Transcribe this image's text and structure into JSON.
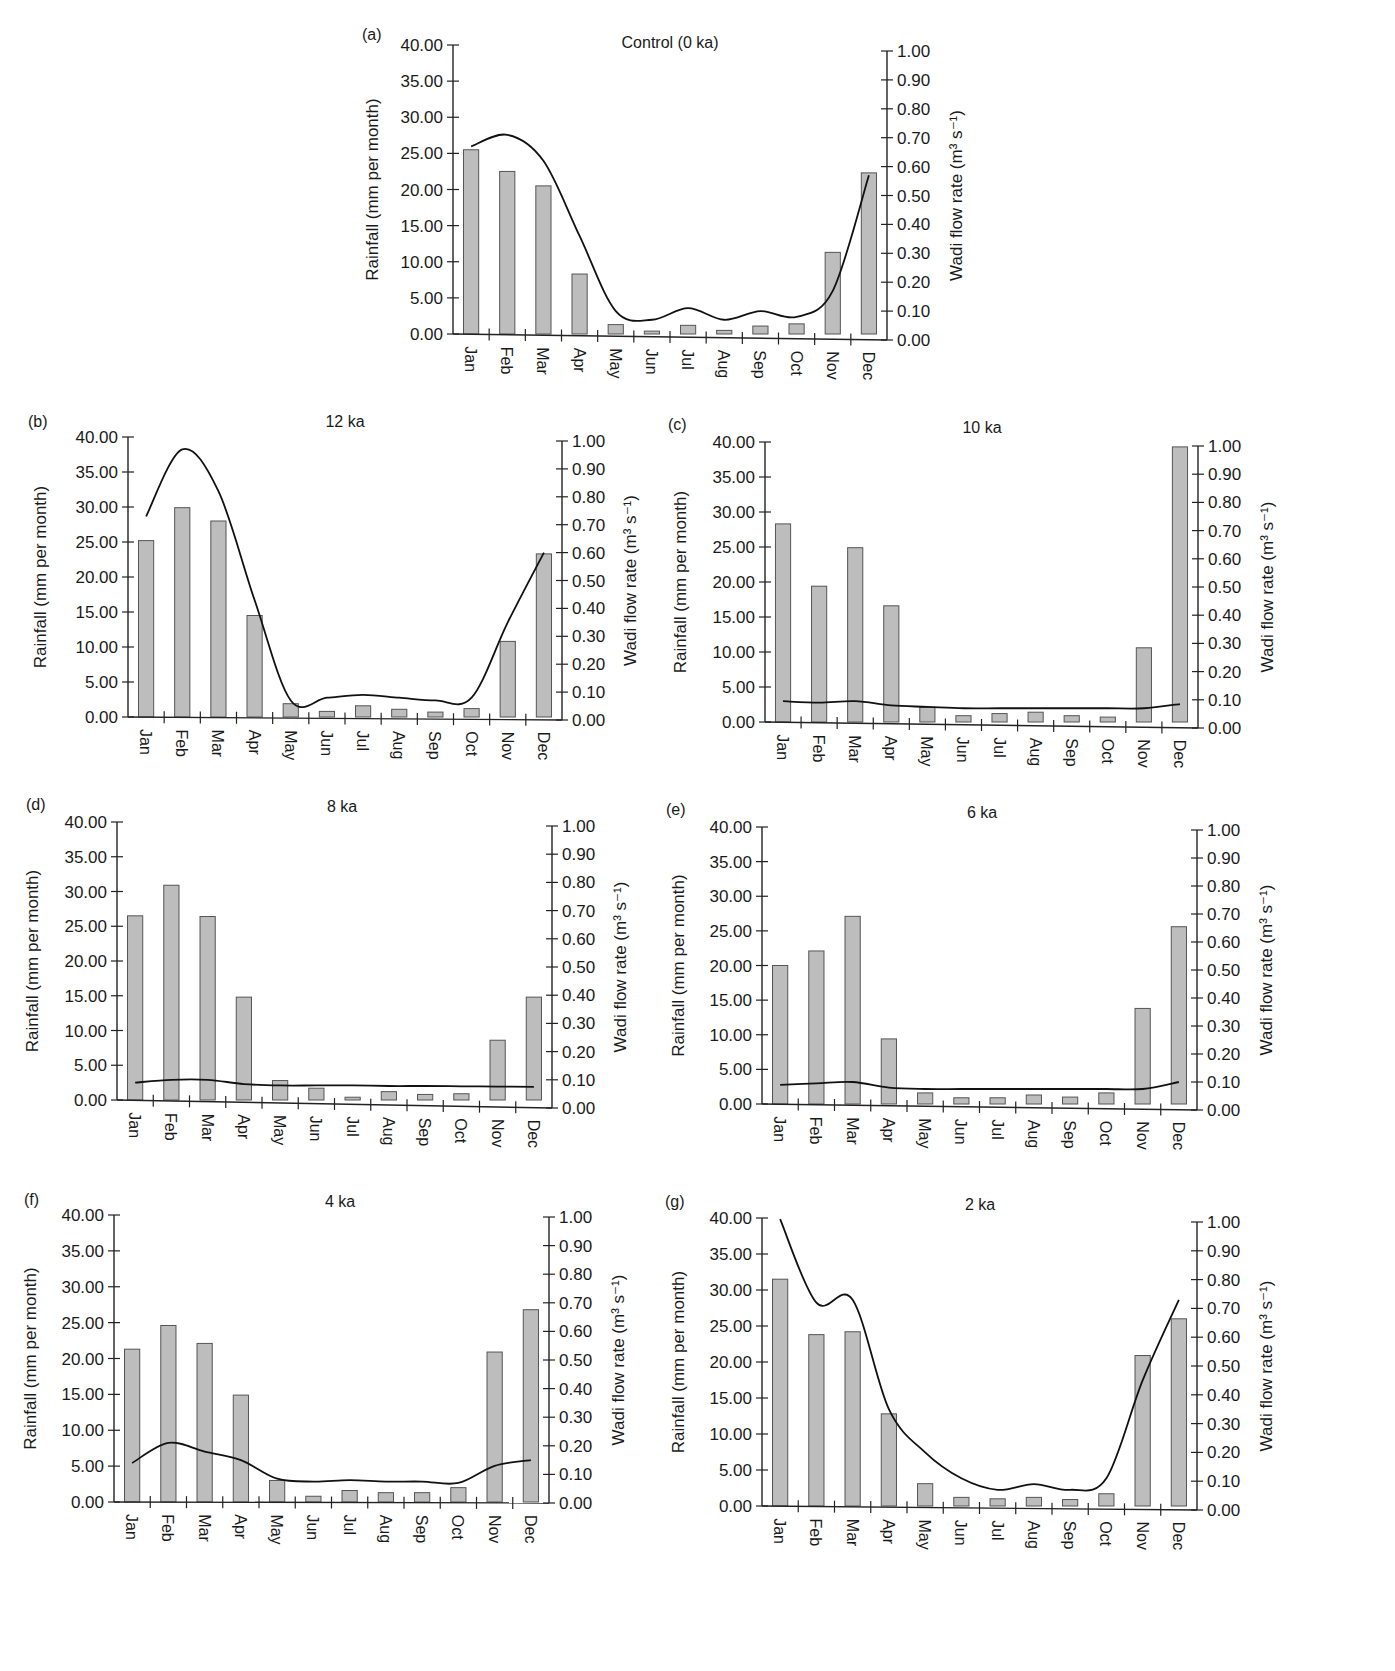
{
  "figure": {
    "months": [
      "Jan",
      "Feb",
      "Mar",
      "Apr",
      "May",
      "Jun",
      "Jul",
      "Aug",
      "Sep",
      "Oct",
      "Nov",
      "Dec"
    ],
    "left_axis_title": "Rainfall (mm per month)",
    "right_axis_title": "Wadi flow rate (m³ s⁻¹)",
    "left_ticks": [
      "0.00",
      "5.00",
      "10.00",
      "15.00",
      "20.00",
      "25.00",
      "30.00",
      "35.00",
      "40.00"
    ],
    "right_ticks": [
      "0.00",
      "0.10",
      "0.20",
      "0.30",
      "0.40",
      "0.50",
      "0.60",
      "0.70",
      "0.80",
      "0.90",
      "1.00"
    ],
    "bar_color": "#bdbdbd",
    "line_color": "#111111"
  },
  "chart_data": [
    {
      "panel": "(a)",
      "type": "bar+line",
      "title": "Control (0 ka)",
      "xlabel": "",
      "ylabel": "Rainfall (mm per month)",
      "y2label": "Wadi flow rate (m³ s⁻¹)",
      "ylim": [
        0,
        40
      ],
      "y2lim": [
        0,
        1
      ],
      "categories": [
        "Jan",
        "Feb",
        "Mar",
        "Apr",
        "May",
        "Jun",
        "Jul",
        "Aug",
        "Sep",
        "Oct",
        "Nov",
        "Dec"
      ],
      "series": [
        {
          "name": "Rainfall",
          "type": "bar",
          "axis": "left",
          "values": [
            25.5,
            22.5,
            20.5,
            8.3,
            1.3,
            0.4,
            1.2,
            0.5,
            1.1,
            1.4,
            11.3,
            22.3
          ]
        },
        {
          "name": "Wadi flow rate",
          "type": "line",
          "axis": "right",
          "values": [
            0.67,
            0.71,
            0.62,
            0.36,
            0.1,
            0.07,
            0.11,
            0.07,
            0.1,
            0.08,
            0.17,
            0.57
          ]
        }
      ],
      "layout": {
        "x0": 453,
        "x1": 887,
        "yTop": 45,
        "yBot": 334,
        "rTop": 51,
        "rBot": 340,
        "title_x": 670,
        "title_y": 48,
        "letter_x": 362,
        "letter_y": 40,
        "ylab_x": 378,
        "y2lab_x": 962
      }
    },
    {
      "panel": "(b)",
      "type": "bar+line",
      "title": "12 ka",
      "xlabel": "",
      "ylabel": "Rainfall (mm per month)",
      "y2label": "Wadi flow rate (m³ s⁻¹)",
      "ylim": [
        0,
        40
      ],
      "y2lim": [
        0,
        1
      ],
      "categories": [
        "Jan",
        "Feb",
        "Mar",
        "Apr",
        "May",
        "Jun",
        "Jul",
        "Aug",
        "Sep",
        "Oct",
        "Nov",
        "Dec"
      ],
      "series": [
        {
          "name": "Rainfall",
          "type": "bar",
          "axis": "left",
          "values": [
            25.2,
            29.9,
            28.0,
            14.5,
            1.9,
            0.8,
            1.6,
            1.1,
            0.7,
            1.2,
            10.8,
            23.3
          ]
        },
        {
          "name": "Wadi flow rate",
          "type": "line",
          "axis": "right",
          "values": [
            0.73,
            0.97,
            0.82,
            0.43,
            0.07,
            0.08,
            0.09,
            0.08,
            0.07,
            0.08,
            0.35,
            0.6
          ]
        }
      ],
      "layout": {
        "x0": 128,
        "x1": 562,
        "yTop": 437,
        "yBot": 717,
        "rTop": 441,
        "rBot": 720,
        "title_x": 345,
        "title_y": 427,
        "letter_x": 28,
        "letter_y": 427,
        "ylab_x": 46,
        "y2lab_x": 636
      }
    },
    {
      "panel": "(c)",
      "type": "bar+line",
      "title": "10 ka",
      "xlabel": "",
      "ylabel": "Rainfall (mm per month)",
      "y2label": "Wadi flow rate (m³ s⁻¹)",
      "ylim": [
        0,
        40
      ],
      "y2lim": [
        0,
        1
      ],
      "categories": [
        "Jan",
        "Feb",
        "Mar",
        "Apr",
        "May",
        "Jun",
        "Jul",
        "Aug",
        "Sep",
        "Oct",
        "Nov",
        "Dec"
      ],
      "series": [
        {
          "name": "Rainfall",
          "type": "bar",
          "axis": "left",
          "values": [
            28.3,
            19.4,
            24.9,
            16.6,
            2.1,
            0.9,
            1.2,
            1.4,
            0.9,
            0.7,
            10.6,
            39.3
          ]
        },
        {
          "name": "Wadi flow rate",
          "type": "line",
          "axis": "right",
          "values": [
            0.095,
            0.09,
            0.095,
            0.08,
            0.075,
            0.07,
            0.07,
            0.07,
            0.07,
            0.07,
            0.07,
            0.085
          ]
        }
      ],
      "layout": {
        "x0": 765,
        "x1": 1198,
        "yTop": 442,
        "yBot": 722,
        "rTop": 446,
        "rBot": 728,
        "title_x": 982,
        "title_y": 433,
        "letter_x": 668,
        "letter_y": 430,
        "ylab_x": 686,
        "y2lab_x": 1273
      }
    },
    {
      "panel": "(d)",
      "type": "bar+line",
      "title": "8 ka",
      "xlabel": "",
      "ylabel": "Rainfall (mm per month)",
      "y2label": "Wadi flow rate (m³ s⁻¹)",
      "ylim": [
        0,
        40
      ],
      "y2lim": [
        0,
        1
      ],
      "categories": [
        "Jan",
        "Feb",
        "Mar",
        "Apr",
        "May",
        "Jun",
        "Jul",
        "Aug",
        "Sep",
        "Oct",
        "Nov",
        "Dec"
      ],
      "series": [
        {
          "name": "Rainfall",
          "type": "bar",
          "axis": "left",
          "values": [
            26.5,
            30.9,
            26.4,
            14.8,
            2.8,
            1.7,
            0.4,
            1.2,
            0.8,
            0.9,
            8.6,
            14.8
          ]
        },
        {
          "name": "Wadi flow rate",
          "type": "line",
          "axis": "right",
          "values": [
            0.09,
            0.1,
            0.1,
            0.085,
            0.08,
            0.08,
            0.08,
            0.078,
            0.078,
            0.077,
            0.076,
            0.075
          ]
        }
      ],
      "layout": {
        "x0": 117,
        "x1": 552,
        "yTop": 822,
        "yBot": 1100,
        "rTop": 826,
        "rBot": 1108,
        "title_x": 342,
        "title_y": 812,
        "letter_x": 26,
        "letter_y": 810,
        "ylab_x": 38,
        "y2lab_x": 626
      }
    },
    {
      "panel": "(e)",
      "type": "bar+line",
      "title": "6 ka",
      "xlabel": "",
      "ylabel": "Rainfall (mm per month)",
      "y2label": "Wadi flow rate (m³ s⁻¹)",
      "ylim": [
        0,
        40
      ],
      "y2lim": [
        0,
        1
      ],
      "categories": [
        "Jan",
        "Feb",
        "Mar",
        "Apr",
        "May",
        "Jun",
        "Jul",
        "Aug",
        "Sep",
        "Oct",
        "Nov",
        "Dec"
      ],
      "series": [
        {
          "name": "Rainfall",
          "type": "bar",
          "axis": "left",
          "values": [
            20.0,
            22.1,
            27.1,
            9.4,
            1.6,
            0.9,
            0.9,
            1.3,
            1.0,
            1.6,
            13.8,
            25.6
          ]
        },
        {
          "name": "Wadi flow rate",
          "type": "line",
          "axis": "right",
          "values": [
            0.09,
            0.095,
            0.1,
            0.08,
            0.075,
            0.075,
            0.075,
            0.075,
            0.075,
            0.075,
            0.075,
            0.1
          ]
        }
      ],
      "layout": {
        "x0": 762,
        "x1": 1197,
        "yTop": 827,
        "yBot": 1104,
        "rTop": 830,
        "rBot": 1110,
        "title_x": 982,
        "title_y": 818,
        "letter_x": 666,
        "letter_y": 815,
        "ylab_x": 684,
        "y2lab_x": 1272
      }
    },
    {
      "panel": "(f)",
      "type": "bar+line",
      "title": "4 ka",
      "xlabel": "",
      "ylabel": "Rainfall (mm per month)",
      "y2label": "Wadi flow rate (m³ s⁻¹)",
      "ylim": [
        0,
        40
      ],
      "y2lim": [
        0,
        1
      ],
      "categories": [
        "Jan",
        "Feb",
        "Mar",
        "Apr",
        "May",
        "Jun",
        "Jul",
        "Aug",
        "Sep",
        "Oct",
        "Nov",
        "Dec"
      ],
      "series": [
        {
          "name": "Rainfall",
          "type": "bar",
          "axis": "left",
          "values": [
            21.3,
            24.6,
            22.1,
            14.9,
            3.0,
            0.8,
            1.6,
            1.3,
            1.3,
            2.0,
            20.9,
            26.8
          ]
        },
        {
          "name": "Wadi flow rate",
          "type": "line",
          "axis": "right",
          "values": [
            0.14,
            0.21,
            0.18,
            0.15,
            0.085,
            0.075,
            0.08,
            0.075,
            0.075,
            0.07,
            0.13,
            0.15
          ]
        }
      ],
      "layout": {
        "x0": 114,
        "x1": 549,
        "yTop": 1215,
        "yBot": 1502,
        "rTop": 1217,
        "rBot": 1503,
        "title_x": 340,
        "title_y": 1207,
        "letter_x": 24,
        "letter_y": 1205,
        "ylab_x": 36,
        "y2lab_x": 624
      }
    },
    {
      "panel": "(g)",
      "type": "bar+line",
      "title": "2 ka",
      "xlabel": "",
      "ylabel": "Rainfall (mm per month)",
      "y2label": "Wadi flow rate (m³ s⁻¹)",
      "ylim": [
        0,
        40
      ],
      "y2lim": [
        0,
        1
      ],
      "categories": [
        "Jan",
        "Feb",
        "Mar",
        "Apr",
        "May",
        "Jun",
        "Jul",
        "Aug",
        "Sep",
        "Oct",
        "Nov",
        "Dec"
      ],
      "series": [
        {
          "name": "Rainfall",
          "type": "bar",
          "axis": "left",
          "values": [
            31.5,
            23.8,
            24.2,
            12.8,
            3.1,
            1.2,
            1.0,
            1.2,
            0.9,
            1.7,
            20.9,
            26.0
          ]
        },
        {
          "name": "Wadi flow rate",
          "type": "line",
          "axis": "right",
          "values": [
            1.01,
            0.72,
            0.73,
            0.35,
            0.2,
            0.11,
            0.07,
            0.09,
            0.07,
            0.11,
            0.45,
            0.73
          ]
        }
      ],
      "layout": {
        "x0": 762,
        "x1": 1197,
        "yTop": 1218,
        "yBot": 1506,
        "rTop": 1222,
        "rBot": 1510,
        "title_x": 980,
        "title_y": 1210,
        "letter_x": 665,
        "letter_y": 1207,
        "ylab_x": 684,
        "y2lab_x": 1272
      }
    }
  ]
}
